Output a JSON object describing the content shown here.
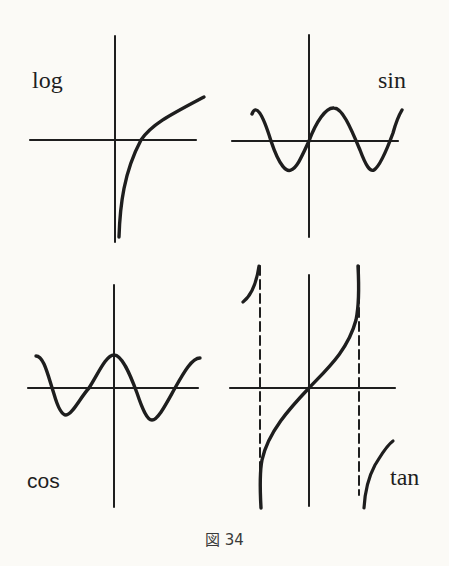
{
  "figure": {
    "caption": "図 34",
    "background": "#fbfaf6",
    "ink_color": "#1e1e1e"
  },
  "panels": [
    {
      "id": "log",
      "label": "log",
      "position": "top-left",
      "function": "y = log(x)"
    },
    {
      "id": "sin",
      "label": "sin",
      "position": "top-right",
      "function": "y = sin(x)"
    },
    {
      "id": "cos",
      "label": "cos",
      "position": "bottom-left",
      "function": "y = cos(x)"
    },
    {
      "id": "tan",
      "label": "tan",
      "position": "bottom-right",
      "function": "y = tan(x)",
      "asymptotes": "dashed vertical lines at x = -π/2 and x = π/2"
    }
  ]
}
